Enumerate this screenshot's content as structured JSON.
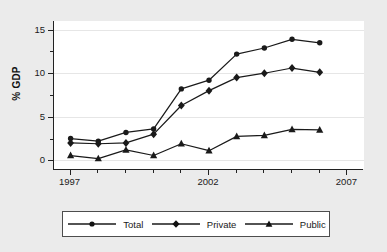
{
  "chart_data": {
    "type": "line",
    "title": "",
    "subtitle": "",
    "xlabel": "",
    "ylabel": "% GDP",
    "xlim": [
      1996.4,
      2007.6
    ],
    "ylim": [
      -1.0,
      16.0
    ],
    "grid": true,
    "legend_position": "bottom",
    "x": [
      1997,
      1998,
      1999,
      2000,
      2001,
      2002,
      2003,
      2004,
      2005,
      2006
    ],
    "xticks": [
      1997,
      2002,
      2007
    ],
    "xtick_labels": [
      "1997",
      "2002",
      "2007"
    ],
    "xticks_minor": [
      1998,
      1999,
      2000,
      2001,
      2003,
      2004,
      2005,
      2006
    ],
    "yticks": [
      0,
      5,
      10,
      15
    ],
    "ytick_labels": [
      "0",
      "5",
      "10",
      "15"
    ],
    "yticks_minor": [
      2.5,
      7.5,
      12.5
    ],
    "series": [
      {
        "name": "Total",
        "marker": "circle",
        "values": [
          2.5,
          2.2,
          3.2,
          3.6,
          8.2,
          9.2,
          12.2,
          12.9,
          13.9,
          13.5
        ]
      },
      {
        "name": "Private",
        "marker": "diamond",
        "values": [
          2.0,
          1.9,
          2.0,
          3.0,
          6.3,
          8.0,
          9.5,
          10.0,
          10.6,
          10.1
        ]
      },
      {
        "name": "Public",
        "marker": "triangle",
        "values": [
          0.55,
          0.2,
          1.2,
          0.55,
          1.9,
          1.1,
          2.75,
          2.85,
          3.55,
          3.5
        ]
      }
    ]
  },
  "legend": {
    "items": [
      {
        "label": "Total",
        "marker": "circle"
      },
      {
        "label": "Private",
        "marker": "diamond"
      },
      {
        "label": "Public",
        "marker": "triangle"
      }
    ]
  },
  "colors": {
    "series_line": "#1a1a1a",
    "plot_background": "#ffffff",
    "figure_background": "#ebebeb",
    "gridline": "#e6e6e6",
    "axis": "#222222",
    "legend_border": "#4d4d4d"
  }
}
